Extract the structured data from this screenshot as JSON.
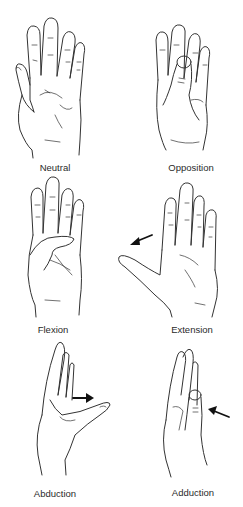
{
  "figure": {
    "panels": [
      {
        "id": "neutral",
        "label": "Neutral",
        "has_arrow": false
      },
      {
        "id": "opposition",
        "label": "Opposition",
        "has_arrow": false
      },
      {
        "id": "flexion",
        "label": "Flexion",
        "has_arrow": false
      },
      {
        "id": "extension",
        "label": "Extension",
        "has_arrow": true,
        "arrow_direction": "left"
      },
      {
        "id": "abduction",
        "label": "Abduction",
        "has_arrow": true,
        "arrow_direction": "right"
      },
      {
        "id": "adduction",
        "label": "Adduction",
        "has_arrow": true,
        "arrow_direction": "left"
      }
    ]
  }
}
